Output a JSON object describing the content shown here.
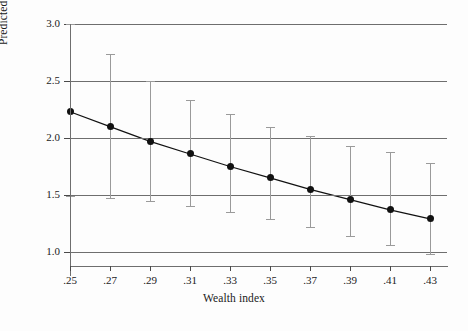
{
  "chart_data": {
    "type": "line",
    "title": "",
    "xlabel": "Wealth index",
    "ylabel": "Predicted count of caravans",
    "x": [
      0.25,
      0.27,
      0.29,
      0.31,
      0.33,
      0.35,
      0.37,
      0.39,
      0.41,
      0.43
    ],
    "xtick_labels": [
      ".25",
      ".27",
      ".29",
      ".31",
      ".33",
      ".35",
      ".37",
      ".39",
      ".41",
      ".43"
    ],
    "ytick_labels": [
      "1.0",
      "1.5",
      "2.0",
      "2.5",
      "3.0"
    ],
    "ytick_values": [
      1.0,
      1.5,
      2.0,
      2.5,
      3.0
    ],
    "xlim": [
      0.24,
      0.44
    ],
    "ylim": [
      0.88,
      3.0
    ],
    "grid": "horizontal",
    "legend": "none",
    "marker": "filled-circle",
    "series": [
      {
        "name": "Predicted count of caravans",
        "values": [
          2.23,
          2.1,
          1.97,
          1.86,
          1.75,
          1.65,
          1.55,
          1.46,
          1.37,
          1.29
        ],
        "error_low": [
          1.49,
          1.47,
          1.45,
          1.4,
          1.35,
          1.29,
          1.22,
          1.14,
          1.06,
          0.98
        ],
        "error_high": [
          3.0,
          2.74,
          2.5,
          2.33,
          2.21,
          2.1,
          2.02,
          1.93,
          1.88,
          1.78
        ]
      }
    ]
  },
  "figure": {
    "ylabel_text": "Predicted count of caravans",
    "xlabel_text": "Wealth index"
  }
}
